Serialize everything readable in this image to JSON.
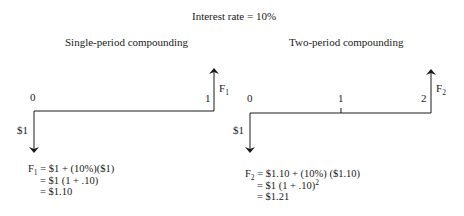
{
  "header": {
    "title": "Interest rate = 10%"
  },
  "diagrams": [
    {
      "title": "Single-period compounding",
      "period_labels": [
        "0",
        "1"
      ],
      "outflow_label": "$1",
      "inflow_label_base": "F",
      "inflow_label_sub": "1",
      "equation": {
        "line1_lhs_base": "F",
        "line1_lhs_sub": "1",
        "line1_rhs": " = $1 + (10%)($1)",
        "line2": "= $1 (1 + .10)",
        "line3": "= $1.10"
      }
    },
    {
      "title": "Two-period compounding",
      "period_labels": [
        "0",
        "1",
        "2"
      ],
      "outflow_label": "$1",
      "inflow_label_base": "F",
      "inflow_label_sub": "2",
      "equation": {
        "line1_lhs_base": "F",
        "line1_lhs_sub": "2",
        "line1_rhs": " = $1.10 + (10%) ($1.10)",
        "line2": "= $1 (1 + .10)",
        "line2_sup": "2",
        "line3": "= $1.21"
      }
    }
  ]
}
